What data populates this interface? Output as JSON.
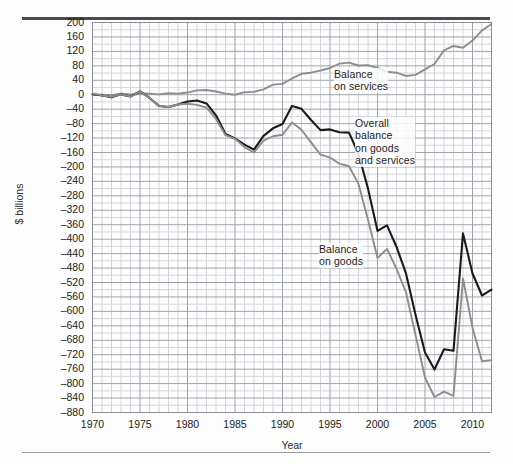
{
  "chart_data": {
    "type": "line",
    "title": "",
    "xlabel": "Year",
    "ylabel": "$ billions",
    "xlim": [
      1970,
      2012
    ],
    "ylim": [
      -880,
      200
    ],
    "ytick_step": 40,
    "xtick_step": 5,
    "grid": true,
    "minor_grid": true,
    "legend": "inline-annotations",
    "x": [
      1970,
      1971,
      1972,
      1973,
      1974,
      1975,
      1976,
      1977,
      1978,
      1979,
      1980,
      1981,
      1982,
      1983,
      1984,
      1985,
      1986,
      1987,
      1988,
      1989,
      1990,
      1991,
      1992,
      1993,
      1994,
      1995,
      1996,
      1997,
      1998,
      1999,
      2000,
      2001,
      2002,
      2003,
      2004,
      2005,
      2006,
      2007,
      2008,
      2009,
      2010,
      2011,
      2012
    ],
    "series": [
      {
        "name": "Balance on services",
        "color": "#8d8d8d",
        "values": [
          -1,
          0,
          -1,
          3,
          1,
          4,
          3,
          1,
          4,
          3,
          6,
          12,
          13,
          9,
          3,
          0,
          7,
          8,
          15,
          28,
          30,
          45,
          58,
          61,
          67,
          74,
          86,
          89,
          81,
          82,
          74,
          64,
          61,
          52,
          55,
          70,
          85,
          123,
          135,
          130,
          150,
          178,
          196
        ]
      },
      {
        "name": "Overall balance on goods and services",
        "color": "#1a1a1a",
        "values": [
          2,
          -2,
          -7,
          1,
          -5,
          9,
          -9,
          -31,
          -34,
          -27,
          -19,
          -16,
          -24,
          -57,
          -109,
          -121,
          -138,
          -152,
          -114,
          -93,
          -81,
          -31,
          -39,
          -70,
          -98,
          -96,
          -104,
          -105,
          -164,
          -260,
          -377,
          -362,
          -421,
          -495,
          -609,
          -714,
          -761,
          -705,
          -709,
          -384,
          -495,
          -556,
          -540
        ]
      },
      {
        "name": "Balance on goods",
        "color": "#8d8d8d",
        "values": [
          3,
          -2,
          -6,
          1,
          -5,
          9,
          -9,
          -31,
          -34,
          -27,
          -25,
          -28,
          -36,
          -67,
          -112,
          -122,
          -145,
          -160,
          -127,
          -115,
          -111,
          -77,
          -97,
          -132,
          -166,
          -174,
          -191,
          -198,
          -247,
          -346,
          -452,
          -427,
          -482,
          -547,
          -665,
          -783,
          -837,
          -822,
          -834,
          -509,
          -645,
          -738,
          -735
        ]
      }
    ],
    "annotations": [
      {
        "name": "balance-on-services",
        "text": "Balance\non services",
        "x_px": 334,
        "y_px": 68
      },
      {
        "name": "overall-balance",
        "text": "Overall\nbalance\non goods\nand services",
        "x_px": 355,
        "y_px": 117
      },
      {
        "name": "balance-on-goods",
        "text": "Balance\non goods",
        "x_px": 319,
        "y_px": 243
      }
    ],
    "ytick_labels": [
      "200",
      "160",
      "120",
      "80",
      "40",
      "0",
      "–40",
      "–80",
      "–120",
      "–160",
      "–200",
      "–240",
      "–280",
      "–320",
      "–360",
      "–400",
      "–440",
      "–480",
      "–520",
      "–560",
      "–600",
      "–640",
      "–680",
      "–720",
      "–760",
      "–800",
      "–840",
      "–880"
    ],
    "xtick_labels": [
      "1970",
      "1975",
      "1980",
      "1985",
      "1990",
      "1995",
      "2000",
      "2005",
      "2010"
    ],
    "axis_colors": {
      "grid_major": "#9fa3aa",
      "grid_minor": "#d3d6da",
      "frame": "#8b8f95",
      "rule_top": "#4a4a4a",
      "rule_bottom": "#9a9a9a"
    }
  }
}
